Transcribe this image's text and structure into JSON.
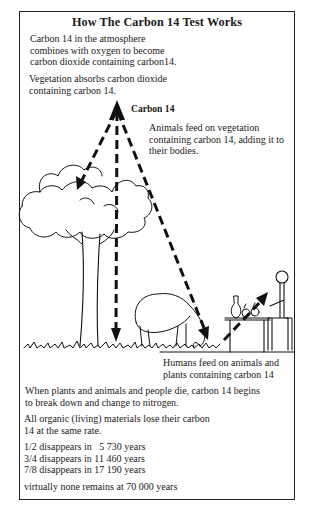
{
  "title": "How The Carbon 14 Test Works",
  "captions": {
    "atmosphere": [
      "Carbon 14 in the atmosphere",
      "combines with oxygen to become",
      "carbon dioxide containing carbon14."
    ],
    "vegetation": [
      "Vegetation absorbs carbon dioxide",
      "containing carbon 14."
    ],
    "carbon_label": "Carbon 14",
    "animals": [
      "Animals feed on vegetation",
      "containing carbon 14, adding it to",
      "their bodies."
    ],
    "humans": [
      "Humans feed on animals and",
      "plants containing carbon 14"
    ],
    "decay": [
      "When plants and animals and people die, carbon 14 begins",
      "to break down and change to nitrogen."
    ],
    "rate": [
      "All organic (living) materials lose their carbon",
      "14 at the same rate."
    ]
  },
  "half_life_table": [
    {
      "fraction": "1/2",
      "text": "1/2 disappears in   5 730 years"
    },
    {
      "fraction": "3/4",
      "text": "3/4 disappears in 11 460 years"
    },
    {
      "fraction": "7/8",
      "text": "7/8 disappears in 17 190 years"
    }
  ],
  "footer": "virtually none remains at 70 000 years",
  "illustration": {
    "elements": [
      "carbon-14-source-arrowhead",
      "tree",
      "grazing-animal",
      "seated-human-at-table",
      "grass-ground-line"
    ],
    "arrows": [
      "source-to-tree",
      "source-to-ground",
      "source-to-animal",
      "animal-to-human"
    ],
    "line_color": "#111111"
  }
}
